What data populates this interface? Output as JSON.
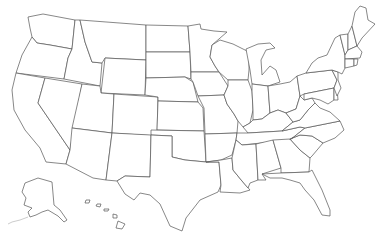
{
  "map": {
    "title": "",
    "type": "blank-outline-map",
    "region": "United States",
    "style": {
      "background": "#ffffff",
      "stroke": "#555555",
      "fill": "#ffffff"
    },
    "regions": [
      "Washington",
      "Oregon",
      "California",
      "Nevada",
      "Idaho",
      "Montana",
      "Wyoming",
      "Utah",
      "Arizona",
      "Colorado",
      "New Mexico",
      "North Dakota",
      "South Dakota",
      "Nebraska",
      "Kansas",
      "Oklahoma",
      "Texas",
      "Minnesota",
      "Iowa",
      "Missouri",
      "Arkansas",
      "Louisiana",
      "Wisconsin",
      "Illinois",
      "Michigan",
      "Indiana",
      "Ohio",
      "Kentucky",
      "Tennessee",
      "Mississippi",
      "Alabama",
      "Georgia",
      "Florida",
      "South Carolina",
      "North Carolina",
      "Virginia",
      "West Virginia",
      "Maryland",
      "Delaware",
      "Pennsylvania",
      "New Jersey",
      "New York",
      "Connecticut",
      "Rhode Island",
      "Massachusetts",
      "Vermont",
      "New Hampshire",
      "Maine",
      "Alaska",
      "Hawaii"
    ],
    "labels_visible": false
  }
}
